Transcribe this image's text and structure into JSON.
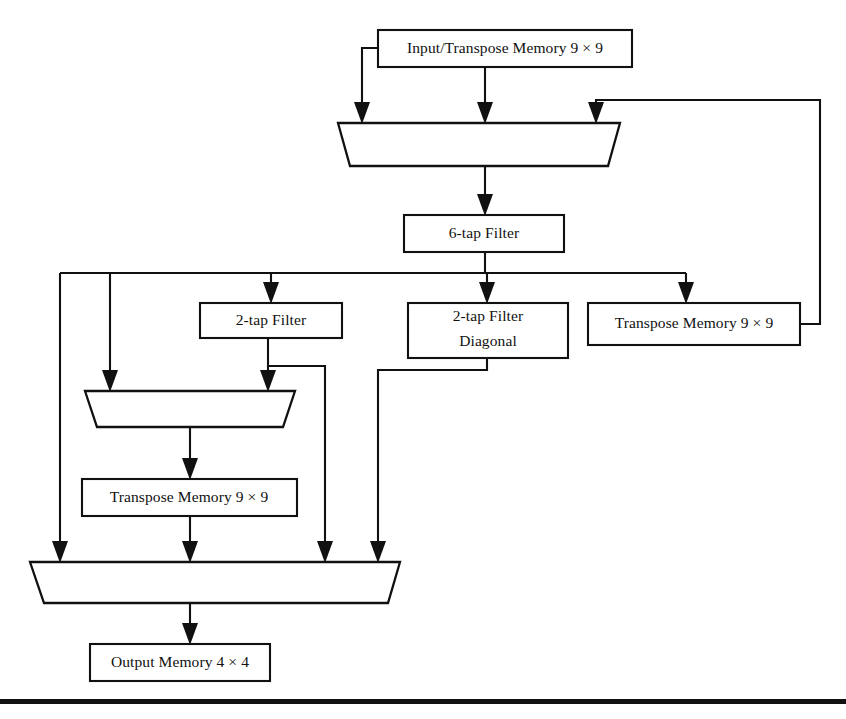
{
  "diagram": {
    "type": "block-diagram",
    "canvas": {
      "width": 846,
      "height": 719
    },
    "colors": {
      "stroke": "#111111",
      "fill": "#ffffff",
      "background": "#ffffff"
    },
    "blocks": [
      {
        "id": "input-transpose-memory",
        "label": "Input/Transpose Memory 9 × 9",
        "shape": "rect",
        "x": 378,
        "y": 30,
        "w": 254,
        "h": 37
      },
      {
        "id": "six-tap-filter",
        "label": "6-tap Filter",
        "shape": "rect",
        "x": 404,
        "y": 215,
        "w": 160,
        "h": 37
      },
      {
        "id": "two-tap-filter",
        "label": "2-tap Filter",
        "shape": "rect",
        "x": 200,
        "y": 303,
        "w": 142,
        "h": 35
      },
      {
        "id": "two-tap-filter-diagonal",
        "label_line1": "2-tap Filter",
        "label_line2": "Diagonal",
        "shape": "rect",
        "x": 408,
        "y": 303,
        "w": 160,
        "h": 55
      },
      {
        "id": "transpose-memory-right",
        "label": "Transpose Memory 9 × 9",
        "shape": "rect",
        "x": 588,
        "y": 303,
        "w": 212,
        "h": 42
      },
      {
        "id": "transpose-memory-left",
        "label": "Transpose Memory 9 × 9",
        "shape": "rect",
        "x": 82,
        "y": 479,
        "w": 215,
        "h": 37
      },
      {
        "id": "output-memory",
        "label": "Output Memory 4 × 4",
        "shape": "rect",
        "x": 90,
        "y": 644,
        "w": 180,
        "h": 37
      }
    ],
    "multiplexers": [
      {
        "id": "mux-top",
        "shape": "trapezoid",
        "top_left": 338,
        "top_right": 620,
        "bottom_left": 350,
        "bottom_right": 608,
        "y_top": 123,
        "y_bottom": 166,
        "input_count": 3,
        "inputs_x": [
          362,
          485,
          596
        ],
        "output_x": 485
      },
      {
        "id": "mux-middle",
        "shape": "trapezoid",
        "top_left": 85,
        "top_right": 295,
        "bottom_left": 97,
        "bottom_right": 283,
        "y_top": 391,
        "y_bottom": 427,
        "input_count": 2,
        "inputs_x": [
          110,
          268
        ],
        "output_x": 190
      },
      {
        "id": "mux-bottom",
        "shape": "trapezoid",
        "top_left": 30,
        "top_right": 400,
        "bottom_left": 44,
        "bottom_right": 388,
        "y_top": 562,
        "y_bottom": 603,
        "input_count": 4,
        "inputs_x": [
          56,
          190,
          325,
          378
        ],
        "output_x": 190
      }
    ],
    "connections": [
      {
        "id": "wire-input-left-to-mux-top-in1",
        "from": "input-transpose-memory",
        "to": "mux-top",
        "note": "left side of input memory routes left then down into mux input 1"
      },
      {
        "id": "wire-input-bottom-to-mux-top-in2",
        "from": "input-transpose-memory",
        "to": "mux-top",
        "note": "bottom of input memory down into mux input 2"
      },
      {
        "id": "wire-transpose-right-feedback-to-mux-top-in3",
        "from": "transpose-memory-right",
        "to": "mux-top",
        "note": "feedback loop right, up, left, down into mux input 3"
      },
      {
        "id": "wire-mux-top-to-six-tap",
        "from": "mux-top",
        "to": "six-tap-filter"
      },
      {
        "id": "wire-six-tap-to-bus",
        "from": "six-tap-filter",
        "to": "distribution-bus"
      },
      {
        "id": "wire-bus-to-two-tap",
        "from": "distribution-bus",
        "to": "two-tap-filter"
      },
      {
        "id": "wire-bus-to-two-tap-diagonal",
        "from": "distribution-bus",
        "to": "two-tap-filter-diagonal"
      },
      {
        "id": "wire-bus-to-transpose-right",
        "from": "distribution-bus",
        "to": "transpose-memory-right"
      },
      {
        "id": "wire-bus-to-mux-bottom-in1",
        "from": "distribution-bus",
        "to": "mux-bottom"
      },
      {
        "id": "wire-bus-to-mux-middle-in1",
        "from": "distribution-bus",
        "to": "mux-middle"
      },
      {
        "id": "wire-two-tap-to-mux-middle-in2",
        "from": "two-tap-filter",
        "to": "mux-middle"
      },
      {
        "id": "wire-two-tap-to-mux-bottom-in3",
        "from": "two-tap-filter",
        "to": "mux-bottom"
      },
      {
        "id": "wire-two-tap-diagonal-to-mux-bottom-in4",
        "from": "two-tap-filter-diagonal",
        "to": "mux-bottom"
      },
      {
        "id": "wire-mux-middle-to-transpose-left",
        "from": "mux-middle",
        "to": "transpose-memory-left"
      },
      {
        "id": "wire-transpose-left-to-mux-bottom-in2",
        "from": "transpose-memory-left",
        "to": "mux-bottom"
      },
      {
        "id": "wire-mux-bottom-to-output-memory",
        "from": "mux-bottom",
        "to": "output-memory"
      }
    ],
    "footer_rule": {
      "y": 699,
      "height": 5
    }
  }
}
